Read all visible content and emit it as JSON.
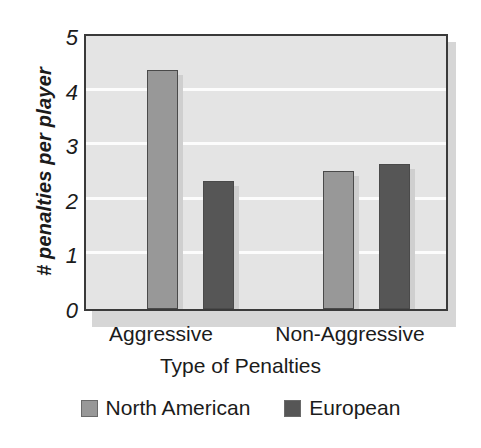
{
  "chart_data": {
    "type": "bar",
    "title": "",
    "xlabel": "Type of Penalties",
    "ylabel": "# penalties per player",
    "categories": [
      "Aggressive",
      "Non-Aggressive"
    ],
    "series": [
      {
        "name": "North American",
        "color": "#989898",
        "values": [
          4.38,
          2.53
        ]
      },
      {
        "name": "European",
        "color": "#565656",
        "values": [
          2.35,
          2.65
        ]
      }
    ],
    "ylim": [
      0,
      5
    ],
    "yticks": [
      "0",
      "1",
      "2",
      "3",
      "4",
      "5"
    ],
    "ytick_values": [
      0,
      1,
      2,
      3,
      4,
      5
    ],
    "gridlines": [
      1,
      2,
      3,
      4
    ],
    "grid": true,
    "grid_color": "#fcfcfc",
    "plot_background": "#e4e4e4",
    "legend_position": "bottom-center"
  },
  "axes": {
    "y_label": "# penalties per player",
    "x_label": "Type of Penalties"
  },
  "legend": {
    "items": [
      {
        "label": "North American",
        "swatch": "legend-swatch-north-american"
      },
      {
        "label": "European",
        "swatch": "legend-swatch-european"
      }
    ]
  }
}
